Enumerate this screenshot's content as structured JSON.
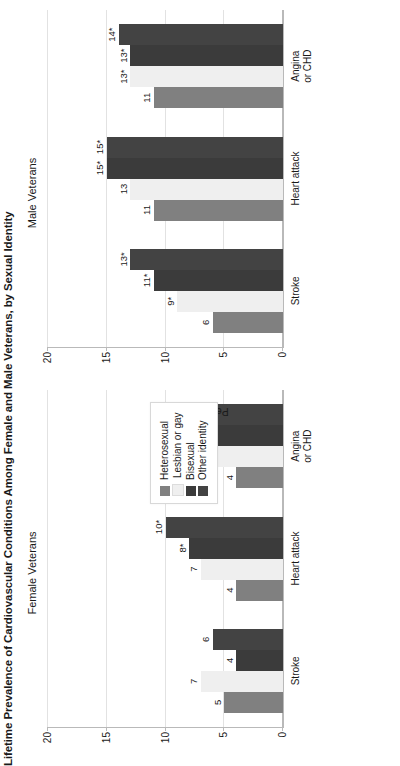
{
  "figure": {
    "title": "Lifetime Prevalence of Cardiovascular Conditions Among Female and Male Veterans, by Sexual Identity"
  },
  "legend": {
    "position": "center",
    "entries": [
      {
        "label": "Heterosexual",
        "color": "#808080"
      },
      {
        "label": "Lesbian or gay",
        "color": "#efefef"
      },
      {
        "label": "Bisexual",
        "color": "#3b3b3b"
      },
      {
        "label": "Other identity",
        "color": "#434343"
      }
    ]
  },
  "panels": [
    {
      "id": "female",
      "title": "Female Veterans",
      "ylabel": "Percentage"
    },
    {
      "id": "male",
      "title": "Male Veterans",
      "ylabel": "Percentage"
    }
  ],
  "axis": {
    "ticks": [
      "0",
      "5",
      "10",
      "15",
      "20"
    ],
    "values": [
      0,
      5,
      10,
      15,
      20
    ],
    "label": "Percentage"
  },
  "chart_data": {
    "type": "bar",
    "title": "Lifetime Prevalence of Cardiovascular Conditions Among Female and Male Veterans, by Sexual Identity",
    "xlabel": "",
    "ylabel": "Percentage",
    "ylim": [
      0,
      20
    ],
    "yticks": [
      0,
      5,
      10,
      15,
      20
    ],
    "grid": "horizontal",
    "legend_position": "center",
    "categories": [
      "Stroke",
      "Heart attack",
      "Angina\nor CHD"
    ],
    "panels": [
      {
        "name": "Female Veterans",
        "series": [
          {
            "name": "Heterosexual",
            "color": "#808080",
            "values": [
              5,
              4,
              4
            ],
            "labels": [
              "5",
              "4",
              "4"
            ]
          },
          {
            "name": "Lesbian or gay",
            "color": "#efefef",
            "values": [
              7,
              7,
              8
            ],
            "labels": [
              "7",
              "7",
              "8*"
            ]
          },
          {
            "name": "Bisexual",
            "color": "#3b3b3b",
            "values": [
              4,
              8,
              7
            ],
            "labels": [
              "4",
              "8*",
              "7*"
            ]
          },
          {
            "name": "Other identity",
            "color": "#434343",
            "values": [
              6,
              10,
              7
            ],
            "labels": [
              "6",
              "10*",
              "7*"
            ]
          }
        ]
      },
      {
        "name": "Male Veterans",
        "series": [
          {
            "name": "Heterosexual",
            "color": "#808080",
            "values": [
              6,
              11,
              11
            ],
            "labels": [
              "6",
              "11",
              "11"
            ]
          },
          {
            "name": "Lesbian or gay",
            "color": "#efefef",
            "values": [
              9,
              13,
              13
            ],
            "labels": [
              "9*",
              "13",
              "13*"
            ]
          },
          {
            "name": "Bisexual",
            "color": "#3b3b3b",
            "values": [
              11,
              15,
              13
            ],
            "labels": [
              "11*",
              "15*",
              "13*"
            ]
          },
          {
            "name": "Other identity",
            "color": "#434343",
            "values": [
              13,
              15,
              14
            ],
            "labels": [
              "13*",
              "15*",
              "14*"
            ]
          }
        ]
      }
    ]
  }
}
